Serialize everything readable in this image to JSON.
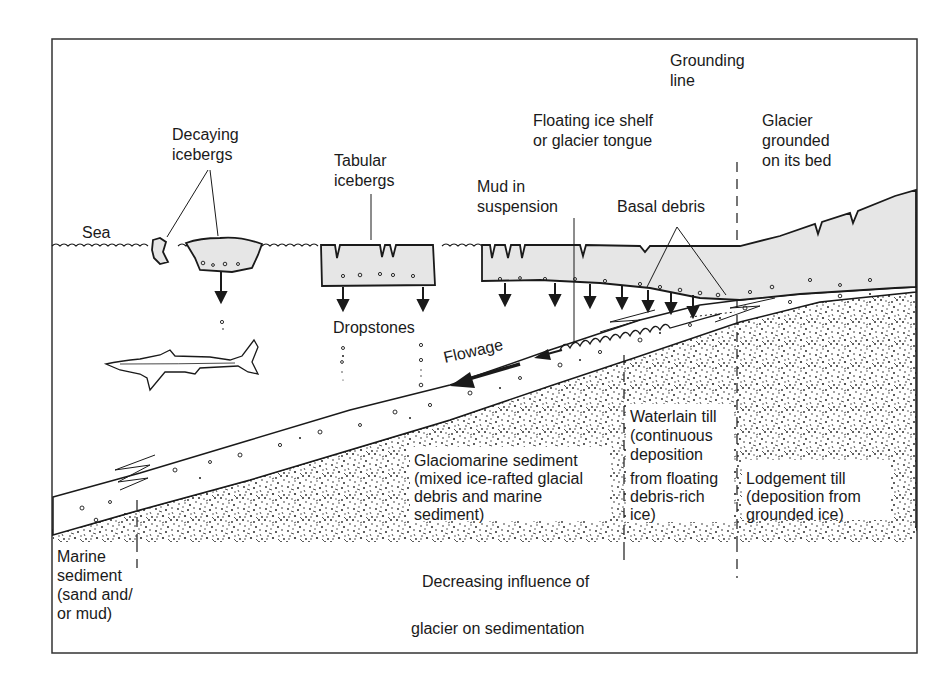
{
  "diagram": {
    "type": "glaciomarine-sedimentation-cross-section",
    "colors": {
      "ink": "#1a1a1a",
      "ice": "#e6e6e6",
      "speckle": "#2a2a2a",
      "background": "#ffffff"
    },
    "labels": {
      "grounding_line": [
        "Grounding",
        "line"
      ],
      "decaying_icebergs": [
        "Decaying",
        "icebergs"
      ],
      "tabular_icebergs": [
        "Tabular",
        "icebergs"
      ],
      "floating_ice_shelf": [
        "Floating ice shelf",
        "or glacier tongue"
      ],
      "glacier_grounded": [
        "Glacier",
        "grounded",
        "on its bed"
      ],
      "mud_in_suspension": [
        "Mud in",
        "suspension"
      ],
      "basal_debris": "Basal debris",
      "sea": "Sea",
      "dropstones": "Dropstones",
      "flowage": "Flowage",
      "glaciomarine_sediment": [
        "Glaciomarine sediment",
        "(mixed ice-rafted glacial",
        "debris and marine",
        "sediment)"
      ],
      "waterlain_till": [
        "Waterlain till",
        "(continuous",
        "deposition",
        "from floating",
        "debris-rich",
        "ice)"
      ],
      "lodgement_till": [
        "Lodgement till",
        "(deposition from",
        "grounded ice)"
      ],
      "marine_sediment": [
        "Marine",
        "sediment",
        "(sand and/",
        "or mud)"
      ],
      "influence_arrow": [
        "Decreasing influence of",
        "glacier on sedimentation"
      ]
    },
    "icons": {
      "shark": "shark-illustration",
      "drop_arrows": "down-arrow-icon",
      "hollow_arrow": "hollow-left-arrow-icon"
    }
  }
}
